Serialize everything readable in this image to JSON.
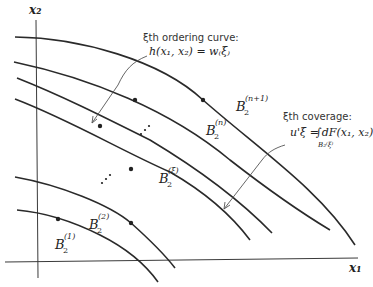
{
  "diagram": {
    "axes": {
      "x_label": "x₁",
      "y_label": "x₂"
    },
    "annotations": {
      "ordering_curve": {
        "title": "ξth ordering curve:",
        "formula": "h(x₁, x₂) = w₍ξ₎"
      },
      "coverage": {
        "title": "ξth coverage:",
        "formula_lhs": "u'ξ =",
        "formula_rhs": "∫dF(x₁, x₂)",
        "integral_domain": "B₂⁽ξ⁾"
      }
    },
    "regions": [
      {
        "base": "B",
        "sub": "2",
        "sup": "(1)"
      },
      {
        "base": "B",
        "sub": "2",
        "sup": "(2)"
      },
      {
        "base": "B",
        "sub": "2",
        "sup": "(ξ)"
      },
      {
        "base": "B",
        "sub": "2",
        "sup": "(n)"
      },
      {
        "base": "B",
        "sub": "2",
        "sup": "(n+1)"
      }
    ],
    "ellipsis": [
      "⋰",
      "⋰"
    ]
  }
}
